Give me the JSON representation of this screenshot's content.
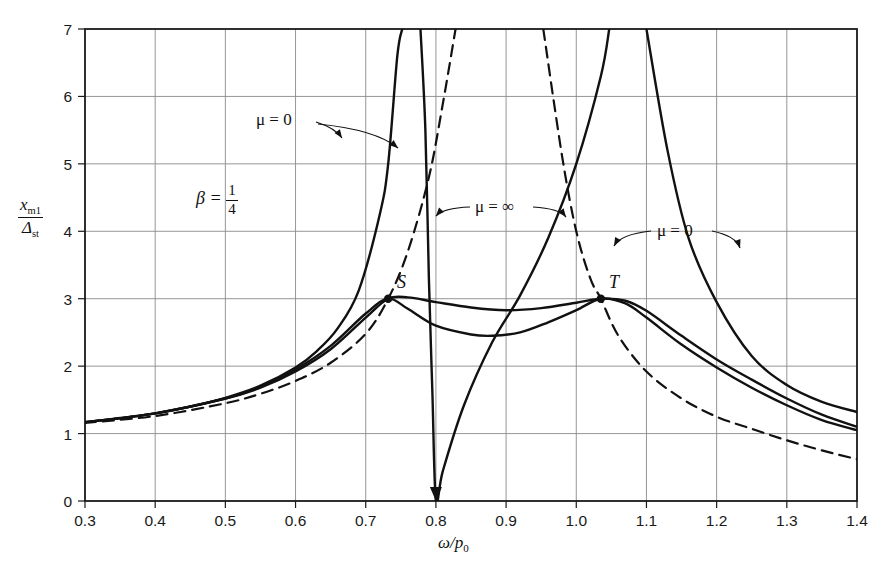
{
  "figure": {
    "background_color": "#ffffff",
    "axis_color": "#1a1a1a",
    "grid_color": "#8a8a8a",
    "curve_color": "#111111"
  },
  "axes": {
    "x_label": "ω/p",
    "x_label_sub": "0",
    "y_label_numerator": "x",
    "y_label_numerator_sub": "m1",
    "y_label_denominator": "Δ",
    "y_label_denominator_sub": "st",
    "x_ticks": [
      "0.3",
      "0.4",
      "0.5",
      "0.6",
      "0.7",
      "0.8",
      "0.9",
      "1.0",
      "1.1",
      "1.2",
      "1.3",
      "1.4"
    ],
    "y_ticks": [
      "0",
      "1",
      "2",
      "3",
      "4",
      "5",
      "6",
      "7"
    ]
  },
  "annotations": {
    "beta_text": "β =",
    "beta_num": "1",
    "beta_den": "4",
    "mu_zero_left": "μ = 0",
    "mu_infinity": "μ = ∞",
    "mu_zero_right": "μ = 0",
    "point_s": "S",
    "point_t": "T"
  },
  "chart_data": {
    "type": "line",
    "title": "",
    "xlabel": "ω/p₀",
    "ylabel": "x_m1 / Δ_st",
    "xlim": [
      0.3,
      1.4
    ],
    "ylim": [
      0,
      7
    ],
    "grid": true,
    "legend": "none",
    "xticks": [
      0.3,
      0.4,
      0.5,
      0.6,
      0.7,
      0.8,
      0.9,
      1.0,
      1.1,
      1.2,
      1.3,
      1.4
    ],
    "yticks": [
      0,
      1,
      2,
      3,
      4,
      5,
      6,
      7
    ],
    "fixed_points": [
      {
        "name": "S",
        "x": 0.732,
        "y": 3.0
      },
      {
        "name": "T",
        "x": 1.035,
        "y": 3.0
      }
    ],
    "series": [
      {
        "name": "mu = 0 (undamped absorber)",
        "style": "solid",
        "asymptotes": [
          0.765,
          1.147
        ],
        "zero_at": 0.8,
        "points": [
          [
            0.3,
            1.17
          ],
          [
            0.35,
            1.23
          ],
          [
            0.4,
            1.3
          ],
          [
            0.45,
            1.4
          ],
          [
            0.5,
            1.53
          ],
          [
            0.55,
            1.71
          ],
          [
            0.6,
            1.98
          ],
          [
            0.63,
            2.22
          ],
          [
            0.66,
            2.56
          ],
          [
            0.69,
            3.12
          ],
          [
            0.72,
            4.25
          ],
          [
            0.732,
            5.0
          ],
          [
            0.745,
            6.6
          ],
          [
            0.752,
            7.0
          ],
          [
            0.778,
            7.0
          ],
          [
            0.785,
            5.5
          ],
          [
            0.79,
            3.3
          ],
          [
            0.795,
            1.6
          ],
          [
            0.8,
            0.0
          ],
          [
            0.81,
            0.45
          ],
          [
            0.84,
            1.42
          ],
          [
            0.88,
            2.35
          ],
          [
            0.92,
            3.05
          ],
          [
            0.96,
            3.9
          ],
          [
            1.0,
            5.0
          ],
          [
            1.035,
            6.3
          ],
          [
            1.047,
            7.0
          ],
          [
            1.1,
            7.0
          ],
          [
            1.13,
            5.2
          ],
          [
            1.16,
            3.9
          ],
          [
            1.2,
            2.95
          ],
          [
            1.25,
            2.15
          ],
          [
            1.3,
            1.72
          ],
          [
            1.35,
            1.47
          ],
          [
            1.4,
            1.32
          ]
        ]
      },
      {
        "name": "mu = infinity (absorber locked)",
        "style": "dashed",
        "asymptotes": [
          0.89,
          1.22
        ],
        "points": [
          [
            0.3,
            1.16
          ],
          [
            0.4,
            1.26
          ],
          [
            0.5,
            1.45
          ],
          [
            0.55,
            1.59
          ],
          [
            0.6,
            1.78
          ],
          [
            0.65,
            2.05
          ],
          [
            0.7,
            2.48
          ],
          [
            0.732,
            3.0
          ],
          [
            0.76,
            3.7
          ],
          [
            0.79,
            4.8
          ],
          [
            0.81,
            5.9
          ],
          [
            0.828,
            7.0
          ],
          [
            0.953,
            7.0
          ],
          [
            0.98,
            5.1
          ],
          [
            1.0,
            4.0
          ],
          [
            1.02,
            3.3
          ],
          [
            1.035,
            3.0
          ],
          [
            1.06,
            2.45
          ],
          [
            1.1,
            1.92
          ],
          [
            1.15,
            1.52
          ],
          [
            1.2,
            1.25
          ],
          [
            1.25,
            1.07
          ],
          [
            1.3,
            0.9
          ],
          [
            1.35,
            0.75
          ],
          [
            1.4,
            0.62
          ]
        ]
      },
      {
        "name": "optimum damping (upper, through S and T)",
        "style": "solid",
        "points": [
          [
            0.3,
            1.17
          ],
          [
            0.4,
            1.3
          ],
          [
            0.5,
            1.52
          ],
          [
            0.55,
            1.68
          ],
          [
            0.6,
            1.92
          ],
          [
            0.65,
            2.25
          ],
          [
            0.7,
            2.72
          ],
          [
            0.732,
            3.0
          ],
          [
            0.76,
            3.02
          ],
          [
            0.8,
            2.95
          ],
          [
            0.85,
            2.87
          ],
          [
            0.9,
            2.83
          ],
          [
            0.95,
            2.86
          ],
          [
            1.0,
            2.94
          ],
          [
            1.035,
            3.0
          ],
          [
            1.07,
            2.97
          ],
          [
            1.1,
            2.82
          ],
          [
            1.15,
            2.45
          ],
          [
            1.2,
            2.1
          ],
          [
            1.25,
            1.8
          ],
          [
            1.3,
            1.52
          ],
          [
            1.35,
            1.28
          ],
          [
            1.4,
            1.1
          ]
        ]
      },
      {
        "name": "intermediate damping (lower, through S and T)",
        "style": "solid",
        "points": [
          [
            0.3,
            1.17
          ],
          [
            0.4,
            1.3
          ],
          [
            0.5,
            1.52
          ],
          [
            0.55,
            1.69
          ],
          [
            0.6,
            1.95
          ],
          [
            0.65,
            2.3
          ],
          [
            0.7,
            2.78
          ],
          [
            0.732,
            3.0
          ],
          [
            0.76,
            2.85
          ],
          [
            0.8,
            2.6
          ],
          [
            0.85,
            2.47
          ],
          [
            0.88,
            2.45
          ],
          [
            0.92,
            2.5
          ],
          [
            0.96,
            2.65
          ],
          [
            1.0,
            2.83
          ],
          [
            1.035,
            3.0
          ],
          [
            1.07,
            2.93
          ],
          [
            1.1,
            2.72
          ],
          [
            1.15,
            2.32
          ],
          [
            1.2,
            1.98
          ],
          [
            1.25,
            1.68
          ],
          [
            1.3,
            1.42
          ],
          [
            1.35,
            1.2
          ],
          [
            1.4,
            1.05
          ]
        ]
      }
    ]
  }
}
